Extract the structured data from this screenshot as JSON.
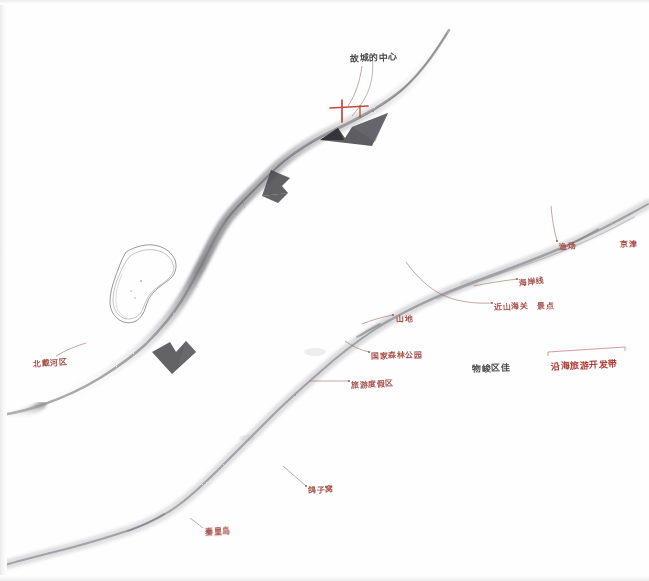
{
  "document": {
    "kind": "scanned hand-drawn map",
    "medium": "pencil shading with red and dark ink handwriting",
    "paper_color": "#fefefe"
  },
  "colors": {
    "ink_red": "#a8514b",
    "ink_red_bright": "#b33a33",
    "ink_dark": "#4a4a4e",
    "terrain_shade": "#8e8e92",
    "contour_line": "#6f6f74",
    "leader_line": "#9a6a66",
    "marker_red": "#c0392b"
  },
  "annotations": [
    {
      "id": "a1",
      "text": "故城的中心",
      "ink": "ink-dark",
      "size": "ann-md",
      "x": 350,
      "y": 52,
      "rotate": -3
    },
    {
      "id": "a2",
      "text": "北戴河区",
      "ink": "ink-red",
      "size": "ann-sm",
      "x": 33,
      "y": 358,
      "rotate": -4
    },
    {
      "id": "a3",
      "text": "山地",
      "ink": "ink-red",
      "size": "ann-sm",
      "x": 396,
      "y": 313,
      "rotate": -3
    },
    {
      "id": "a4",
      "text": "国家森林公园",
      "ink": "ink-red",
      "size": "ann-sm",
      "x": 371,
      "y": 350,
      "rotate": -2
    },
    {
      "id": "a5",
      "text": "旅游度假区",
      "ink": "ink-red",
      "size": "ann-sm",
      "x": 351,
      "y": 379,
      "rotate": -3
    },
    {
      "id": "a6",
      "text": "渔场",
      "ink": "ink-red",
      "size": "ann-sm",
      "x": 559,
      "y": 241,
      "rotate": -5
    },
    {
      "id": "a7",
      "text": "京津",
      "ink": "ink-red",
      "size": "ann-sm",
      "x": 620,
      "y": 238,
      "rotate": -2
    },
    {
      "id": "a8",
      "text": "海岸线",
      "ink": "ink-red",
      "size": "ann-sm",
      "x": 519,
      "y": 277,
      "rotate": -8
    },
    {
      "id": "a9",
      "text": "近山海关",
      "ink": "ink-red",
      "size": "ann-sm",
      "x": 494,
      "y": 301,
      "rotate": -3
    },
    {
      "id": "a10",
      "text": "景点",
      "ink": "ink-red",
      "size": "ann-sm",
      "x": 537,
      "y": 300,
      "rotate": -3
    },
    {
      "id": "a11",
      "text": "物峻区佳",
      "ink": "ink-dark",
      "size": "ann-md",
      "x": 472,
      "y": 362,
      "rotate": -2
    },
    {
      "id": "a12",
      "text": "沿海旅游开发带",
      "ink": "ink-red-bright",
      "size": "ann-md",
      "x": 551,
      "y": 360,
      "rotate": -3
    },
    {
      "id": "a13",
      "text": "鸽子窝",
      "ink": "ink-red",
      "size": "ann-sm",
      "x": 308,
      "y": 484,
      "rotate": -3
    },
    {
      "id": "a14",
      "text": "秦皇岛",
      "ink": "ink-red",
      "size": "ann-sm",
      "x": 205,
      "y": 526,
      "rotate": -4
    }
  ],
  "markers": [
    {
      "id": "m1",
      "name": "cross-marker",
      "x": 343,
      "y": 111,
      "color": "#c0392b"
    }
  ],
  "features": [
    {
      "id": "f1",
      "name": "closed-contour-island",
      "description": "double-outlined closed contour shape (island / lake)"
    },
    {
      "id": "f2",
      "name": "upper-ridge-band",
      "description": "shaded terrain band running from top-right down to the left"
    },
    {
      "id": "f3",
      "name": "lower-ridge-band",
      "description": "shaded terrain band sweeping from lower-left up to the right edge"
    },
    {
      "id": "f4",
      "name": "valley-band",
      "description": "shaded band descending to the bottom-left corner"
    }
  ]
}
